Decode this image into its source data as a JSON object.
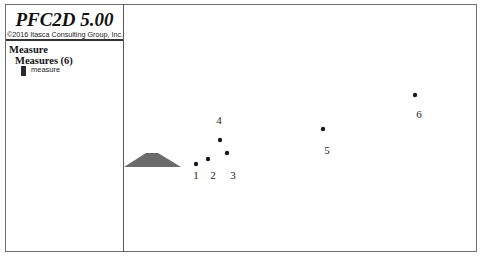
{
  "app": {
    "title": "PFC2D 5.00",
    "copyright": "©2016 Itasca Consulting Group, Inc."
  },
  "legend": {
    "section_title": "Measure",
    "subsection_title": "Measures (6)",
    "items": [
      {
        "label": "measure",
        "swatch_color": "#2a2a2a"
      }
    ]
  },
  "plot": {
    "pile_color": "#6b6b6b",
    "point_color": "#1a1a1a",
    "measure_points": [
      {
        "id": "1",
        "x": 196,
        "y": 164,
        "label_x": 196,
        "label_y": 179
      },
      {
        "id": "2",
        "x": 208,
        "y": 159,
        "label_x": 213,
        "label_y": 179
      },
      {
        "id": "3",
        "x": 227,
        "y": 153,
        "label_x": 233,
        "label_y": 179
      },
      {
        "id": "4",
        "x": 220,
        "y": 140,
        "label_x": 219,
        "label_y": 124
      },
      {
        "id": "5",
        "x": 323,
        "y": 129,
        "label_x": 327,
        "label_y": 154
      },
      {
        "id": "6",
        "x": 415,
        "y": 95,
        "label_x": 419,
        "label_y": 118
      }
    ]
  }
}
